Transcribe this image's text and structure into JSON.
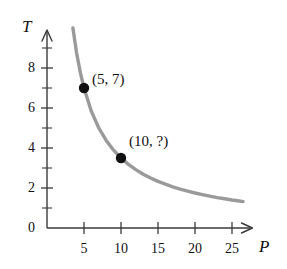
{
  "figure": {
    "background_color": "#ffffff",
    "axis_color": "#3a3a3a",
    "curve_color": "#9a9a9a",
    "point_color": "#111111",
    "text_color": "#111111"
  },
  "chart_data": {
    "type": "line",
    "title": "",
    "subtitle": "",
    "xlabel": "P",
    "ylabel": "T",
    "xlim": [
      0,
      27.5
    ],
    "ylim": [
      0,
      9.8
    ],
    "grid": false,
    "legend": null,
    "curve": {
      "name": "T = 35/P",
      "relationship": "inverse",
      "x": [
        3.5,
        4,
        4.5,
        5,
        6,
        7,
        8,
        9,
        10,
        11,
        12,
        13,
        14,
        15,
        16,
        17,
        18,
        19,
        20,
        21,
        22,
        23,
        24,
        25,
        26,
        26.5
      ],
      "y": [
        10,
        8.75,
        7.78,
        7,
        5.83,
        5,
        4.38,
        3.89,
        3.5,
        3.18,
        2.92,
        2.69,
        2.5,
        2.33,
        2.19,
        2.06,
        1.94,
        1.84,
        1.75,
        1.67,
        1.59,
        1.52,
        1.46,
        1.4,
        1.35,
        1.32
      ]
    },
    "points": [
      {
        "x": 5,
        "y": 7,
        "label": "(5, 7)"
      },
      {
        "x": 10,
        "y": 3.5,
        "label": "(10, ?)"
      }
    ],
    "x_ticks_major": [
      {
        "value": 5,
        "label": "5"
      },
      {
        "value": 10,
        "label": "10"
      },
      {
        "value": 15,
        "label": "15"
      },
      {
        "value": 20,
        "label": "20"
      },
      {
        "value": 25,
        "label": "25"
      }
    ],
    "y_ticks_major": [
      {
        "value": 0,
        "label": "0"
      },
      {
        "value": 2,
        "label": "2"
      },
      {
        "value": 4,
        "label": "4"
      },
      {
        "value": 6,
        "label": "6"
      },
      {
        "value": 8,
        "label": "8"
      }
    ],
    "y_ticks_minor": [
      1,
      3,
      5,
      7,
      9
    ]
  }
}
